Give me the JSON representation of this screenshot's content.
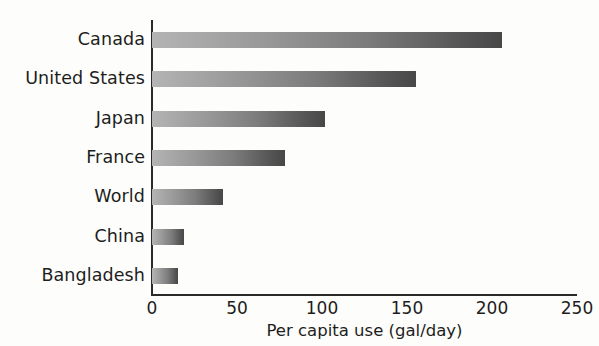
{
  "figure": {
    "background_color": "#fdfdfb",
    "axis_color": "#2a2a2a",
    "bar_gradient_start": "#b4b4b4",
    "bar_gradient_end": "#474747"
  },
  "chart_data": {
    "type": "bar",
    "orientation": "horizontal",
    "title": "",
    "xlabel": "Per capita use (gal/day)",
    "ylabel": "",
    "categories": [
      "Canada",
      "United States",
      "Japan",
      "France",
      "World",
      "China",
      "Bangladesh"
    ],
    "values": [
      206,
      155,
      102,
      78,
      42,
      19,
      15
    ],
    "xlim": [
      0,
      250
    ],
    "xticks": [
      0,
      50,
      100,
      150,
      200,
      250
    ],
    "xtick_labels": [
      "0",
      "50",
      "100",
      "150",
      "200",
      "250"
    ],
    "grid": false,
    "legend": false,
    "series": [
      {
        "name": "Per capita use (gal/day)",
        "values": [
          206,
          155,
          102,
          78,
          42,
          19,
          15
        ]
      }
    ]
  }
}
